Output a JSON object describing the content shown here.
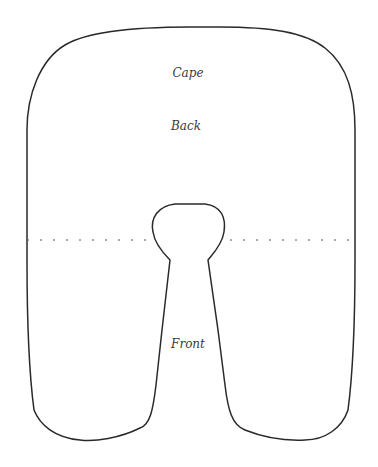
{
  "diagram": {
    "type": "sewing-pattern",
    "labels": {
      "cape": "Cape",
      "back": "Back",
      "front": "Front"
    },
    "colors": {
      "outline": "#2a2a2a",
      "fold_line": "#555555",
      "label": "#3a3a3a",
      "background": "#ffffff"
    },
    "fold_line": {
      "style": "dashed",
      "y": 240
    }
  }
}
